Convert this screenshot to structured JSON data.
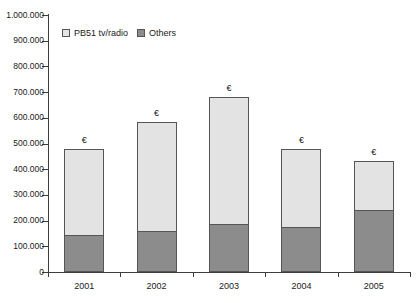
{
  "chart_data": {
    "type": "bar",
    "subtype": "stacked-vertical",
    "title": "",
    "xlabel": "",
    "ylabel": "",
    "categories": [
      "2001",
      "2002",
      "2003",
      "2004",
      "2005"
    ],
    "series": [
      {
        "name": "Others",
        "values": [
          145000,
          160000,
          185000,
          175000,
          240000
        ],
        "color": "#8c8c8c"
      },
      {
        "name": "PB51 tv/radio",
        "values": [
          335000,
          423000,
          495000,
          303000,
          192000
        ],
        "color": "#e3e3e3"
      }
    ],
    "totals": [
      480000,
      583000,
      680000,
      478000,
      432000
    ],
    "stack_order": [
      "Others",
      "PB51 tv/radio"
    ],
    "ylim": [
      0,
      1000000
    ],
    "ytick_values": [
      0,
      100000,
      200000,
      300000,
      400000,
      500000,
      600000,
      700000,
      800000,
      900000,
      1000000
    ],
    "ytick_labels": [
      "0",
      "100.000",
      "200.000",
      "300.000",
      "400.000",
      "500.000",
      "600.000",
      "700.000",
      "800.000",
      "900.000",
      "1.000.000"
    ],
    "grid": false,
    "legend_position": "top-left-inside",
    "legend": [
      {
        "label": "PB51 tv/radio",
        "color": "#e3e3e3"
      },
      {
        "label": "Others",
        "color": "#8c8c8c"
      }
    ],
    "bar_annotations": [
      "€",
      "€",
      "€",
      "€",
      "€"
    ],
    "annotation_note": "euro-symbol above each bar"
  },
  "colors": {
    "series_light": "#e3e3e3",
    "series_dark": "#8c8c8c",
    "outline": "#555555",
    "axis": "#3d3d3d",
    "text": "#1a1a1a",
    "background": "#ffffff"
  }
}
